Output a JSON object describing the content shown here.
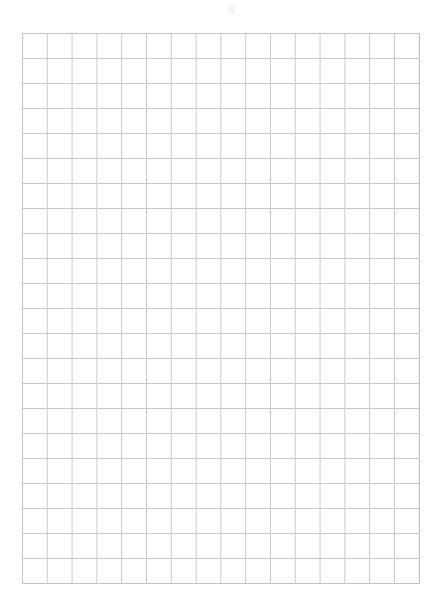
{
  "page": {
    "width": 441,
    "height": 615,
    "background_color": "#ffffff",
    "content_text": ""
  },
  "grid": {
    "name": "graph-paper-grid",
    "columns": 16,
    "rows": 22,
    "cell_width": 24.8,
    "cell_height": 25.0,
    "origin_x": 22,
    "origin_y": 33,
    "width": 397,
    "height": 550,
    "line_color": "#cacaca",
    "border_color": "#c4c4c4",
    "line_width": 1,
    "fill_color": "#ffffff",
    "labels": [],
    "tick_labels": [],
    "annotations": []
  },
  "artifact": {
    "name": "page-speck",
    "x": 228,
    "y": 5,
    "color": "#9a9a9a",
    "opacity": 0.1
  },
  "chart_data": {
    "type": "table",
    "title": "",
    "subtitle": "",
    "xlabel": "",
    "ylabel": "",
    "grid": true,
    "legend": [],
    "categories": [],
    "values": [],
    "series": []
  }
}
